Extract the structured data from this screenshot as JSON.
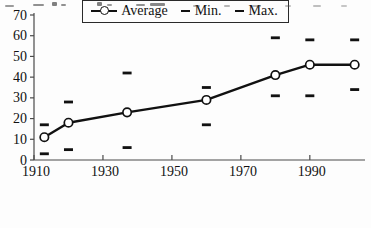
{
  "chart_data": {
    "type": "line",
    "title": "",
    "xlabel": "",
    "ylabel": "",
    "x": [
      1913,
      1920,
      1937,
      1960,
      1980,
      1990,
      2003
    ],
    "series": [
      {
        "name": "Average",
        "marker": "line-circle",
        "values": [
          11,
          18,
          23,
          29,
          41,
          46,
          46
        ]
      },
      {
        "name": "Min.",
        "marker": "dash",
        "values": [
          3,
          5,
          6,
          17,
          31,
          31,
          34
        ]
      },
      {
        "name": "Max.",
        "marker": "dash",
        "values": [
          17,
          28,
          42,
          35,
          59,
          58,
          58
        ]
      }
    ],
    "xlim": [
      1910,
      2006
    ],
    "ylim": [
      0,
      70
    ],
    "x_ticks": [
      1910,
      1930,
      1950,
      1970,
      1990
    ],
    "y_ticks": [
      0,
      10,
      20,
      30,
      40,
      50,
      60,
      70
    ],
    "grid": false,
    "legend_position": "bottom-center"
  },
  "legend": {
    "items": [
      {
        "label": "Average",
        "symbol": "line-circle"
      },
      {
        "label": "Min.",
        "symbol": "dash"
      },
      {
        "label": "Max.",
        "symbol": "dash"
      }
    ]
  },
  "colors": {
    "series_line": "#111111",
    "marker_fill": "#ffffff",
    "axis": "#4a4a4a",
    "text": "#111111",
    "background": "#fdfdfd",
    "legend_border": "#2a2a2a"
  }
}
